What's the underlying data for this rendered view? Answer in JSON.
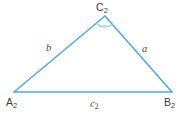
{
  "figure": {
    "kind": "triangle-diagram",
    "background_color": "#ffffff",
    "stroke_color": "#4aaede",
    "arc_color": "#8fcfe8",
    "vertex_label_color": "#3b3b3b",
    "side_label_color": "#5c4038",
    "stroke_width": 1.6,
    "vertices": [
      {
        "name": "A2",
        "label": "A",
        "subscript": "2",
        "x": 14,
        "y": 92
      },
      {
        "name": "B2",
        "label": "B",
        "subscript": "2",
        "x": 172,
        "y": 92
      },
      {
        "name": "C2",
        "label": "C",
        "subscript": "2",
        "x": 105,
        "y": 16
      }
    ],
    "sides": [
      {
        "name": "side-b",
        "label": "b",
        "subscript": "",
        "between": "A2-C2"
      },
      {
        "name": "side-a",
        "label": "a",
        "subscript": "",
        "between": "C2-B2"
      },
      {
        "name": "side-c2",
        "label": "c",
        "subscript": "2",
        "between": "A2-B2"
      }
    ],
    "angle_marker": {
      "at_vertex": "C2",
      "type": "arc",
      "radius": 11
    }
  }
}
